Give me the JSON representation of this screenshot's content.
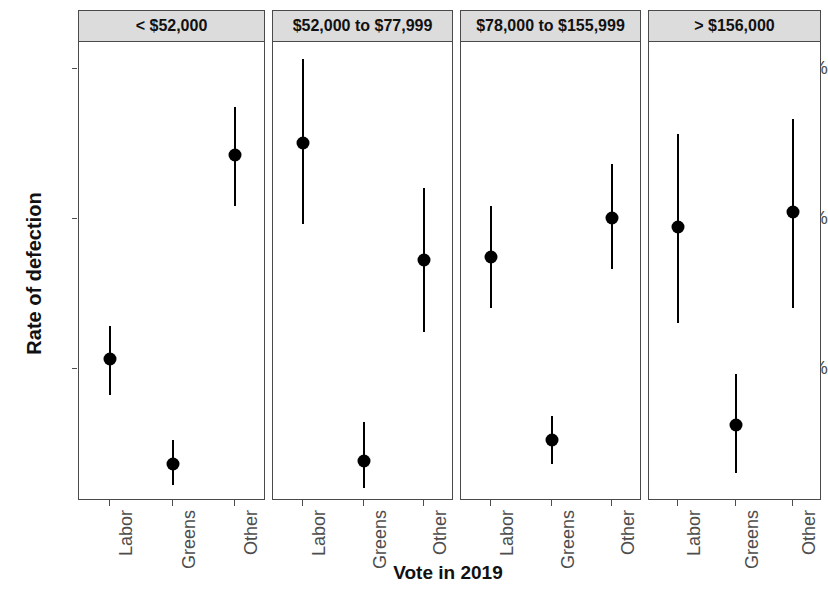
{
  "chart_data": {
    "type": "scatter",
    "title": "",
    "xlabel": "Vote in 2019",
    "ylabel": "Rate of defection",
    "ylim": [
      0,
      16.2
    ],
    "y_ticks": [
      {
        "value": 15,
        "label": "15%"
      },
      {
        "value": 10,
        "label": "10%"
      },
      {
        "value": 5,
        "label": "5%"
      }
    ],
    "grid": false,
    "legend": null,
    "facet_variable": "Household income",
    "categories": [
      "Labor",
      "Greens",
      "Other"
    ],
    "error_bar_kind": "confidence-interval",
    "value_units": "percent",
    "panels": [
      {
        "label": "< $52,000",
        "points": [
          {
            "category": "Labor",
            "value": 5.3,
            "low": 4.1,
            "high": 6.4
          },
          {
            "category": "Greens",
            "value": 1.8,
            "low": 1.1,
            "high": 2.6
          },
          {
            "category": "Other",
            "value": 12.1,
            "low": 10.4,
            "high": 13.7
          }
        ]
      },
      {
        "label": "$52,000 to $77,999",
        "points": [
          {
            "category": "Labor",
            "value": 12.5,
            "low": 9.8,
            "high": 15.3
          },
          {
            "category": "Greens",
            "value": 1.9,
            "low": 1.0,
            "high": 3.2
          },
          {
            "category": "Other",
            "value": 8.6,
            "low": 6.2,
            "high": 11.0
          }
        ]
      },
      {
        "label": "$78,000 to $155,999",
        "points": [
          {
            "category": "Labor",
            "value": 8.7,
            "low": 7.0,
            "high": 10.4
          },
          {
            "category": "Greens",
            "value": 2.6,
            "low": 1.8,
            "high": 3.4
          },
          {
            "category": "Other",
            "value": 10.0,
            "low": 8.3,
            "high": 11.8
          }
        ]
      },
      {
        "label": "> $156,000",
        "points": [
          {
            "category": "Labor",
            "value": 9.7,
            "low": 6.5,
            "high": 12.8
          },
          {
            "category": "Greens",
            "value": 3.1,
            "low": 1.5,
            "high": 4.8
          },
          {
            "category": "Other",
            "value": 10.2,
            "low": 7.0,
            "high": 13.3
          }
        ]
      }
    ],
    "colors": {
      "point": "#000000",
      "errorbar": "#000000",
      "strip_background": "#dcdcdc",
      "panel_border": "#4a4a4a",
      "tick_label": "#4d4d4d",
      "axis_title": "#111111",
      "plot_background": "#ffffff"
    }
  }
}
